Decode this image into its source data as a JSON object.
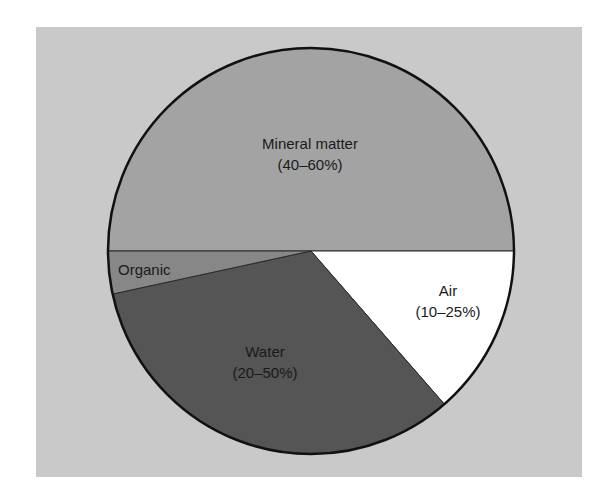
{
  "chart_data": {
    "type": "pie",
    "title": "",
    "start_angle_deg": 180,
    "direction": "clockwise",
    "slices": [
      {
        "label": "Mineral matter",
        "range": "(40–60%)",
        "value": 50,
        "color": "#a3a3a3"
      },
      {
        "label": "Air",
        "range": "(10–25%)",
        "value": 13.6,
        "color": "#ffffff"
      },
      {
        "label": "Water",
        "range": "(20–50%)",
        "value": 33.0,
        "color": "#555555"
      },
      {
        "label": "Organic",
        "range": "",
        "value": 3.4,
        "color": "#878787"
      }
    ],
    "background_color": "#c9c9c9",
    "outline_color": "#111111"
  },
  "labels": {
    "mineral_name": "Mineral matter",
    "mineral_range": "(40–60%)",
    "air_name": "Air",
    "air_range": "(10–25%)",
    "water_name": "Water",
    "water_range": "(20–50%)",
    "organic_name": "Organic"
  }
}
